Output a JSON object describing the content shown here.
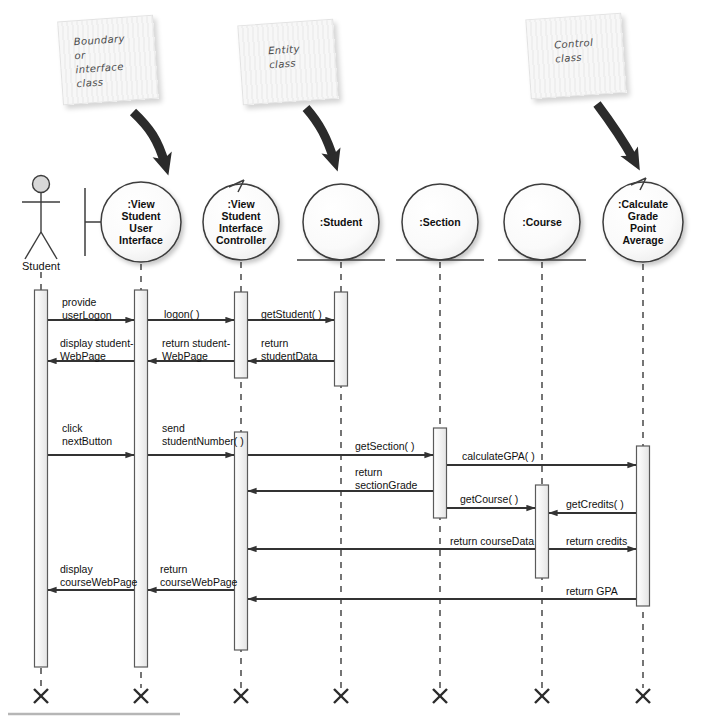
{
  "diagram": {
    "type": "uml-sequence-diagram",
    "title": "",
    "notes": [
      {
        "id": "note-boundary",
        "text": "Boundary\nor\ninterface\nclass",
        "x": 60,
        "y": 18,
        "w": 96,
        "h": 84,
        "rotate": -4,
        "text_x": 14,
        "text_y": 14,
        "points_to": "view-student-user-interface"
      },
      {
        "id": "note-entity",
        "text": "Entity\nclass",
        "x": 240,
        "y": 22,
        "w": 96,
        "h": 80,
        "rotate": -4,
        "text_x": 28,
        "text_y": 20,
        "points_to": "student"
      },
      {
        "id": "note-control",
        "text": "Control\nclass",
        "x": 528,
        "y": 16,
        "w": 96,
        "h": 80,
        "rotate": -4,
        "text_x": 26,
        "text_y": 20,
        "points_to": "calculate-grade-point-average"
      }
    ],
    "lifelines": [
      {
        "id": "student-actor",
        "label": "Student",
        "stereotype": "actor",
        "x": 41,
        "head_y": 222,
        "r": 0
      },
      {
        "id": "view-student-user-interface",
        "label": ":View\nStudent\nUser\nInterface",
        "stereotype": "boundary",
        "x": 141,
        "head_y": 222,
        "r": 40
      },
      {
        "id": "view-student-interface-controller",
        "label": ":View\nStudent\nInterface\nController",
        "stereotype": "control",
        "x": 241,
        "head_y": 222,
        "r": 38
      },
      {
        "id": "student",
        "label": ":Student",
        "stereotype": "entity",
        "x": 341,
        "head_y": 222,
        "r": 38
      },
      {
        "id": "section",
        "label": ":Section",
        "stereotype": "entity",
        "x": 440,
        "head_y": 222,
        "r": 38
      },
      {
        "id": "course",
        "label": ":Course",
        "stereotype": "entity",
        "x": 542,
        "head_y": 222,
        "r": 38
      },
      {
        "id": "calculate-grade-point-average",
        "label": ":Calculate\nGrade\nPoint\nAverage",
        "stereotype": "control",
        "x": 643,
        "head_y": 222,
        "r": 40
      }
    ],
    "activations": [
      {
        "lifeline": "student-actor",
        "top": 290,
        "bottom": 667
      },
      {
        "lifeline": "view-student-user-interface",
        "top": 290,
        "bottom": 667
      },
      {
        "lifeline": "view-student-interface-controller",
        "top": 292,
        "bottom": 378
      },
      {
        "lifeline": "view-student-interface-controller",
        "top": 432,
        "bottom": 650
      },
      {
        "lifeline": "student",
        "top": 292,
        "bottom": 386
      },
      {
        "lifeline": "section",
        "top": 428,
        "bottom": 518
      },
      {
        "lifeline": "course",
        "top": 485,
        "bottom": 578
      },
      {
        "lifeline": "calculate-grade-point-average",
        "top": 446,
        "bottom": 606
      }
    ],
    "messages": [
      {
        "id": "msg-provide-userlogon",
        "label": "provide\nuserLogon",
        "from": 41,
        "to": 141,
        "y": 320,
        "dir": "right",
        "label_x": 62,
        "label_y": 296
      },
      {
        "id": "msg-logon",
        "label": "logon( )",
        "from": 141,
        "to": 241,
        "y": 320,
        "dir": "right",
        "label_x": 164,
        "label_y": 308
      },
      {
        "id": "msg-getstudent",
        "label": "getStudent( )",
        "from": 241,
        "to": 341,
        "y": 320,
        "dir": "right",
        "label_x": 261,
        "label_y": 308
      },
      {
        "id": "msg-return-studentdata",
        "label": "return\nstudentData",
        "from": 341,
        "to": 241,
        "y": 361,
        "dir": "left",
        "label_x": 261,
        "label_y": 337
      },
      {
        "id": "msg-return-studentwebpage",
        "label": "return student-\nWebPage",
        "from": 241,
        "to": 141,
        "y": 361,
        "dir": "left",
        "label_x": 162,
        "label_y": 337
      },
      {
        "id": "msg-display-studentwebpage",
        "label": "display student-\nWebPage",
        "from": 141,
        "to": 41,
        "y": 361,
        "dir": "left",
        "label_x": 60,
        "label_y": 337
      },
      {
        "id": "msg-click-nextbutton",
        "label": "click\nnextButton",
        "from": 41,
        "to": 141,
        "y": 455,
        "dir": "right",
        "label_x": 62,
        "label_y": 422
      },
      {
        "id": "msg-send-studentnumber",
        "label": "send\nstudentNumber( )",
        "from": 141,
        "to": 241,
        "y": 455,
        "dir": "right",
        "label_x": 162,
        "label_y": 422
      },
      {
        "id": "msg-getsection",
        "label": "getSection( )",
        "from": 241,
        "to": 440,
        "y": 455,
        "dir": "right",
        "label_x": 355,
        "label_y": 440
      },
      {
        "id": "msg-calculategpa",
        "label": "calculateGPA( )",
        "from": 440,
        "to": 643,
        "y": 465,
        "dir": "right",
        "label_x": 462,
        "label_y": 450
      },
      {
        "id": "msg-return-sectiongrade",
        "label": "return\nsectionGrade",
        "from": 440,
        "to": 241,
        "y": 491,
        "dir": "left",
        "label_x": 355,
        "label_y": 466
      },
      {
        "id": "msg-getcourse",
        "label": "getCourse( )",
        "from": 440,
        "to": 542,
        "y": 508,
        "dir": "right",
        "label_x": 460,
        "label_y": 493
      },
      {
        "id": "msg-getcredits",
        "label": "getCredits( )",
        "from": 643,
        "to": 542,
        "y": 513,
        "dir": "left",
        "label_x": 566,
        "label_y": 498
      },
      {
        "id": "msg-return-coursedata",
        "label": "return courseData",
        "from": 542,
        "to": 241,
        "y": 549,
        "dir": "left",
        "label_x": 450,
        "label_y": 535
      },
      {
        "id": "msg-return-credits",
        "label": "return credits",
        "from": 542,
        "to": 643,
        "y": 549,
        "dir": "right",
        "label_x": 566,
        "label_y": 535
      },
      {
        "id": "msg-return-coursewebpage",
        "label": "return\ncourseWebPage",
        "from": 241,
        "to": 141,
        "y": 590,
        "dir": "left",
        "label_x": 160,
        "label_y": 563
      },
      {
        "id": "msg-display-coursewebpage",
        "label": "display\ncourseWebPage",
        "from": 141,
        "to": 41,
        "y": 590,
        "dir": "left",
        "label_x": 60,
        "label_y": 563
      },
      {
        "id": "msg-return-gpa",
        "label": "return GPA",
        "from": 643,
        "to": 241,
        "y": 599,
        "dir": "left",
        "label_x": 566,
        "label_y": 585
      }
    ],
    "terminators_y": 696,
    "colors": {
      "line": "#333333",
      "lifeline_dash": "#666666",
      "activation_fill": "#f2f2f2",
      "activation_stroke": "#5a5a5a",
      "head_fill": "#fbfbfb",
      "head_stroke": "#3c3c3c",
      "note_bg": "#f4f4f4",
      "text": "#111111"
    }
  }
}
